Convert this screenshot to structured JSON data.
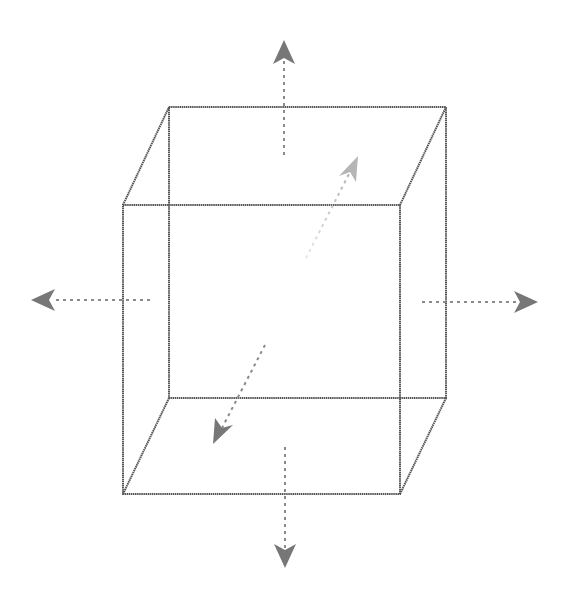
{
  "diagram": {
    "type": "wireframe-cube-with-directional-arrows",
    "background": "#ffffff",
    "edge_color": "#555555",
    "arrow_color": "#777777",
    "back_arrow_color": "#b8b8b8",
    "cube": {
      "front_face": {
        "x1": 123,
        "y1": 205,
        "x2": 400,
        "y2": 494
      },
      "back_face": {
        "x1": 169,
        "y1": 107,
        "x2": 446,
        "y2": 398
      }
    },
    "arrows": [
      {
        "name": "up",
        "from": [
          284,
          155
        ],
        "to": [
          284,
          42
        ]
      },
      {
        "name": "down",
        "from": [
          285,
          447
        ],
        "to": [
          285,
          567
        ]
      },
      {
        "name": "left",
        "from": [
          150,
          300
        ],
        "to": [
          32,
          300
        ]
      },
      {
        "name": "right",
        "from": [
          422,
          302
        ],
        "to": [
          537,
          302
        ]
      },
      {
        "name": "back",
        "from": [
          306,
          258
        ],
        "to": [
          357,
          158
        ]
      },
      {
        "name": "front",
        "from": [
          265,
          345
        ],
        "to": [
          214,
          443
        ]
      }
    ]
  }
}
